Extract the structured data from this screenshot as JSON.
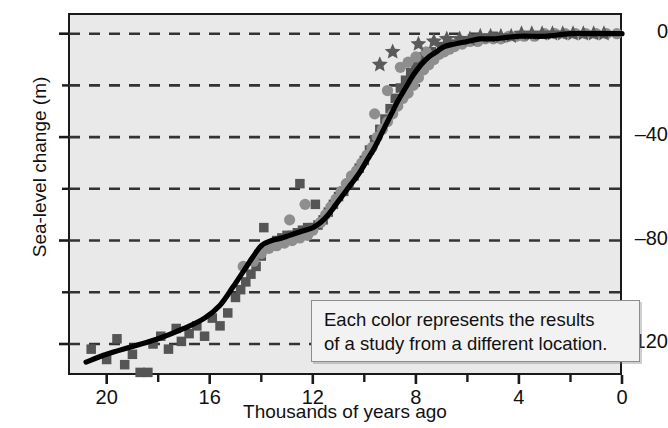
{
  "chart_data": {
    "type": "scatter",
    "title": "",
    "xlabel": "Thousands of years ago",
    "ylabel": "Sea-level change (m)",
    "xlim": [
      21.5,
      0
    ],
    "ylim": [
      -132,
      8
    ],
    "x_ticks": [
      20,
      16,
      12,
      8,
      4,
      0
    ],
    "x_minor_ticks": [
      18,
      14,
      10,
      6,
      2
    ],
    "y_ticks": [
      0,
      -40,
      -80,
      -120
    ],
    "y_gridlines": [
      0,
      -20,
      -40,
      -60,
      -80,
      -100,
      -120
    ],
    "grid": true,
    "grid_style": "dashed",
    "legend": "none",
    "annotation": {
      "line1": "Each color represents the results",
      "line2": "of a study from a different location."
    },
    "colors": {
      "plot_background": "#e9e9e9",
      "axis": "#1a1a1a",
      "gridline": "#333333",
      "trend_line": "#000000",
      "series_squares": "#555555",
      "series_circles": "#8e8e8e",
      "series_stars": "#5a5a5a",
      "annotation_background": "#f2f2f2",
      "annotation_border": "#8d8d8d"
    },
    "series": [
      {
        "name": "study-squares",
        "marker": "square",
        "color": "#555555",
        "points": [
          [
            20.6,
            -122
          ],
          [
            20.0,
            -126
          ],
          [
            19.6,
            -118
          ],
          [
            19.3,
            -128
          ],
          [
            19.0,
            -124
          ],
          [
            18.7,
            -131
          ],
          [
            18.4,
            -131
          ],
          [
            18.2,
            -120
          ],
          [
            17.9,
            -117
          ],
          [
            17.6,
            -122
          ],
          [
            17.3,
            -114
          ],
          [
            17.1,
            -119
          ],
          [
            16.8,
            -116
          ],
          [
            16.5,
            -113
          ],
          [
            16.2,
            -117
          ],
          [
            15.9,
            -110
          ],
          [
            15.6,
            -113
          ],
          [
            15.3,
            -108
          ],
          [
            15.0,
            -102
          ],
          [
            14.8,
            -99
          ],
          [
            14.6,
            -96
          ],
          [
            14.4,
            -93
          ],
          [
            14.2,
            -90
          ],
          [
            14.0,
            -86
          ],
          [
            13.8,
            -83
          ],
          [
            13.6,
            -82
          ],
          [
            13.4,
            -80
          ],
          [
            13.2,
            -79
          ],
          [
            13.0,
            -78
          ],
          [
            12.8,
            -78
          ],
          [
            12.6,
            -77
          ],
          [
            12.4,
            -76
          ],
          [
            12.2,
            -75
          ],
          [
            12.0,
            -75
          ],
          [
            11.8,
            -74
          ],
          [
            11.6,
            -72
          ],
          [
            11.4,
            -69
          ],
          [
            11.2,
            -66
          ],
          [
            11.0,
            -63
          ],
          [
            10.8,
            -61
          ],
          [
            10.6,
            -58
          ],
          [
            10.4,
            -55
          ],
          [
            10.2,
            -52
          ],
          [
            10.0,
            -49
          ],
          [
            9.8,
            -45
          ],
          [
            9.6,
            -41
          ],
          [
            9.4,
            -37
          ],
          [
            9.2,
            -33
          ],
          [
            9.0,
            -29
          ],
          [
            8.8,
            -25
          ],
          [
            8.6,
            -21
          ],
          [
            8.4,
            -18
          ],
          [
            8.2,
            -15
          ],
          [
            8.0,
            -12
          ],
          [
            7.7,
            -9
          ],
          [
            7.4,
            -7
          ],
          [
            7.0,
            -5
          ],
          [
            6.6,
            -4
          ],
          [
            6.2,
            -3
          ],
          [
            5.8,
            -2
          ],
          [
            5.4,
            -2
          ],
          [
            5.0,
            -1
          ],
          [
            12.5,
            -58
          ],
          [
            13.9,
            -75
          ],
          [
            11.9,
            -66
          ]
        ]
      },
      {
        "name": "study-circles",
        "marker": "circle",
        "color": "#8e8e8e",
        "points": [
          [
            14.7,
            -90
          ],
          [
            14.3,
            -88
          ],
          [
            14.0,
            -85
          ],
          [
            13.7,
            -83
          ],
          [
            13.4,
            -82
          ],
          [
            13.1,
            -81
          ],
          [
            12.8,
            -80
          ],
          [
            12.5,
            -79
          ],
          [
            12.2,
            -78
          ],
          [
            12.0,
            -76
          ],
          [
            11.7,
            -73
          ],
          [
            11.5,
            -70
          ],
          [
            11.3,
            -67
          ],
          [
            11.1,
            -64
          ],
          [
            10.9,
            -61
          ],
          [
            10.7,
            -58
          ],
          [
            10.5,
            -55
          ],
          [
            10.3,
            -53
          ],
          [
            10.1,
            -50
          ],
          [
            9.9,
            -47
          ],
          [
            9.7,
            -44
          ],
          [
            9.5,
            -40
          ],
          [
            9.3,
            -37
          ],
          [
            9.1,
            -34
          ],
          [
            8.9,
            -31
          ],
          [
            8.7,
            -28
          ],
          [
            8.5,
            -25
          ],
          [
            8.3,
            -23
          ],
          [
            8.1,
            -20
          ],
          [
            7.9,
            -17
          ],
          [
            7.7,
            -14
          ],
          [
            7.5,
            -12
          ],
          [
            7.3,
            -10
          ],
          [
            7.1,
            -8
          ],
          [
            6.9,
            -7
          ],
          [
            6.7,
            -6
          ],
          [
            6.5,
            -5
          ],
          [
            6.2,
            -4
          ],
          [
            5.9,
            -3
          ],
          [
            5.6,
            -3
          ],
          [
            5.3,
            -2
          ],
          [
            5.0,
            -2
          ],
          [
            4.7,
            -2
          ],
          [
            4.4,
            -1
          ],
          [
            4.1,
            -1
          ],
          [
            3.8,
            -1
          ],
          [
            3.4,
            -1
          ],
          [
            3.0,
            0
          ],
          [
            2.6,
            0
          ],
          [
            2.2,
            0
          ],
          [
            1.8,
            0
          ],
          [
            1.4,
            0
          ],
          [
            1.0,
            0
          ],
          [
            0.6,
            0
          ],
          [
            0.2,
            0
          ],
          [
            8.6,
            -13
          ],
          [
            8.3,
            -11
          ],
          [
            8.0,
            -9
          ],
          [
            7.6,
            -7
          ],
          [
            9.1,
            -22
          ],
          [
            9.6,
            -31
          ],
          [
            12.9,
            -72
          ],
          [
            12.3,
            -66
          ]
        ]
      },
      {
        "name": "study-stars",
        "marker": "star",
        "color": "#5a5a5a",
        "points": [
          [
            9.4,
            -12
          ],
          [
            8.9,
            -7
          ],
          [
            7.9,
            -4
          ],
          [
            7.3,
            -3
          ],
          [
            6.8,
            -2
          ],
          [
            6.3,
            -2
          ],
          [
            5.9,
            -2
          ],
          [
            5.5,
            -1
          ],
          [
            5.1,
            -1
          ],
          [
            4.7,
            -1
          ],
          [
            4.3,
            -1
          ],
          [
            3.9,
            0
          ],
          [
            3.5,
            0
          ],
          [
            3.1,
            0
          ],
          [
            2.7,
            0
          ],
          [
            2.3,
            0
          ],
          [
            1.9,
            0
          ],
          [
            1.5,
            0
          ],
          [
            1.1,
            0
          ],
          [
            0.7,
            0
          ]
        ]
      }
    ],
    "trend_line": {
      "name": "smoothed-sea-level-curve",
      "color": "#000000",
      "points": [
        [
          20.8,
          -127
        ],
        [
          20.0,
          -124
        ],
        [
          19.0,
          -121
        ],
        [
          18.0,
          -118
        ],
        [
          17.0,
          -114
        ],
        [
          16.2,
          -110
        ],
        [
          15.6,
          -105
        ],
        [
          15.1,
          -98
        ],
        [
          14.7,
          -92
        ],
        [
          14.3,
          -86
        ],
        [
          14.0,
          -82
        ],
        [
          13.6,
          -80
        ],
        [
          13.2,
          -79
        ],
        [
          12.9,
          -78
        ],
        [
          12.6,
          -77
        ],
        [
          12.3,
          -76
        ],
        [
          12.0,
          -75
        ],
        [
          11.7,
          -73
        ],
        [
          11.4,
          -70
        ],
        [
          11.1,
          -66
        ],
        [
          10.8,
          -62
        ],
        [
          10.5,
          -58
        ],
        [
          10.2,
          -54
        ],
        [
          9.9,
          -49
        ],
        [
          9.6,
          -44
        ],
        [
          9.3,
          -38
        ],
        [
          9.0,
          -32
        ],
        [
          8.7,
          -26
        ],
        [
          8.4,
          -21
        ],
        [
          8.1,
          -16
        ],
        [
          7.8,
          -12
        ],
        [
          7.5,
          -9
        ],
        [
          7.2,
          -7
        ],
        [
          6.9,
          -5
        ],
        [
          6.5,
          -4
        ],
        [
          6.0,
          -3
        ],
        [
          5.5,
          -2
        ],
        [
          5.0,
          -2
        ],
        [
          4.0,
          -1
        ],
        [
          3.0,
          -1
        ],
        [
          2.0,
          0
        ],
        [
          1.0,
          0
        ],
        [
          0.0,
          0
        ]
      ]
    }
  }
}
